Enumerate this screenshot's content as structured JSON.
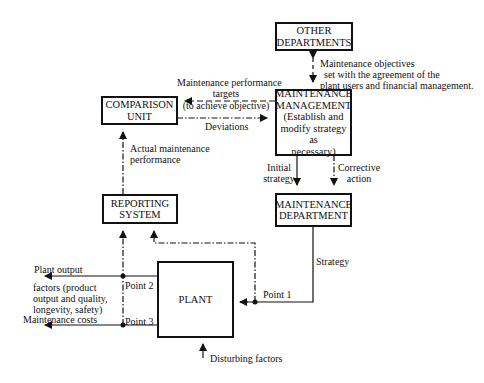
{
  "boxes": {
    "other_departments": {
      "line1": "OTHER",
      "line2": "DEPARTMENTS"
    },
    "maintenance_management": {
      "line1": "MAINTENANCE",
      "line2": "MANAGEMENT",
      "line3": "(Establish and",
      "line4": "modify strategy as",
      "line5": "necessary)"
    },
    "comparison_unit": {
      "line1": "COMPARISON",
      "line2": "UNIT"
    },
    "reporting_system": {
      "line1": "REPORTING",
      "line2": "SYSTEM"
    },
    "maintenance_department": {
      "line1": "MAINTENANCE",
      "line2": "DEPARTMENT"
    },
    "plant": {
      "line1": "PLANT"
    }
  },
  "labels": {
    "objectives": {
      "line1": "Maintenance objectives",
      "line2": "set with the agreement of the",
      "line3": "plant users and financial management."
    },
    "targets": {
      "line1": "Maintenance performance",
      "line2": "targets",
      "line3": "(to achieve objective)"
    },
    "deviations": "Deviations",
    "actual_performance": {
      "line1": "Actual maintenance",
      "line2": "performance"
    },
    "initial_strategy": {
      "line1": "Initial",
      "line2": "strategy"
    },
    "corrective_action": {
      "line1": "Corrective",
      "line2": "action"
    },
    "strategy": "Strategy",
    "point1": "Point 1",
    "point2": "Point 2",
    "point3": "Point 3",
    "plant_output": {
      "line1": "Plant output",
      "line2": "factors (product",
      "line3": "output and quality,",
      "line4": "longevity, safety)"
    },
    "maintenance_costs": "Maintenance costs",
    "disturbing_factors": "Disturbing factors"
  }
}
